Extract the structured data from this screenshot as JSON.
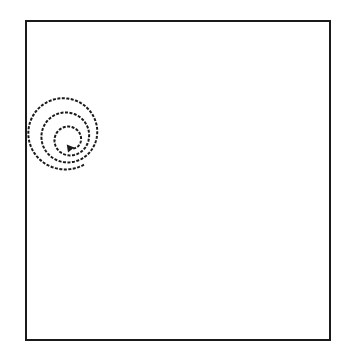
{
  "canvas": {
    "width": 345,
    "height": 349,
    "background": "#ffffff"
  },
  "frame": {
    "x": 26,
    "y": 21,
    "width": 304,
    "height": 319,
    "stroke": "#1a1a1a",
    "stroke_width": 2
  },
  "spiral": {
    "center_x": 64,
    "center_y": 130,
    "start_radius": 6,
    "end_radius": 40,
    "turns": 3.2,
    "start_angle_deg": 60,
    "direction": "clockwise-inward-arrow",
    "stroke": "#1a1a1a",
    "stroke_width": 2,
    "dash": "3 1.5",
    "clip_left_x": 27,
    "arrow": {
      "icon": "arrowhead-icon",
      "x": 68,
      "y": 146
    }
  }
}
